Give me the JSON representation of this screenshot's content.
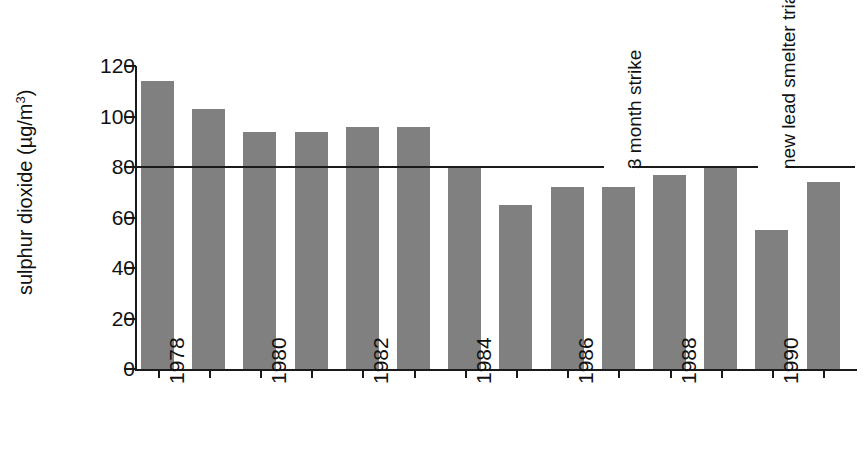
{
  "chart_data": {
    "type": "bar",
    "title": "",
    "subtitle": "",
    "xlabel": "",
    "ylabel": "sulphur dioxide  (µg/m3)",
    "ylabel_parts": {
      "name": "sulphur dioxide",
      "units_open": "  (µg/m",
      "units_exp": "3",
      "units_close": ")"
    },
    "ylim": [
      0,
      120
    ],
    "yticks": [
      0,
      20,
      40,
      60,
      80,
      100,
      120
    ],
    "ytick_labels": [
      "0",
      "20",
      "40",
      "60",
      "80",
      "100",
      "120"
    ],
    "grid": false,
    "legend": null,
    "bar_color": "#808080",
    "axis_color": "#1a1a1a",
    "categories": [
      "1978",
      "1979",
      "1980",
      "1981",
      "1982",
      "1983",
      "1984",
      "1985",
      "1986",
      "1987",
      "1988",
      "1989",
      "1990",
      "1991"
    ],
    "values": [
      114,
      103,
      94,
      94,
      96,
      96,
      80,
      65,
      72,
      72,
      77,
      80,
      55,
      74
    ],
    "xtick_labels_shown": [
      "1978",
      "1980",
      "1982",
      "1984",
      "1986",
      "1988",
      "1990"
    ],
    "xtick_label_indices": [
      0,
      2,
      4,
      6,
      8,
      10,
      12
    ],
    "reference_lines": [
      {
        "value": 80,
        "label": "",
        "color": "#1a1a1a"
      }
    ],
    "annotations": [
      {
        "text": "3 month strike",
        "at_category": "1987",
        "value_anchor": 80,
        "rotation": -90
      },
      {
        "text": "new lead smelter trials",
        "at_category": "1990",
        "value_anchor": 80,
        "rotation": -90
      }
    ]
  }
}
